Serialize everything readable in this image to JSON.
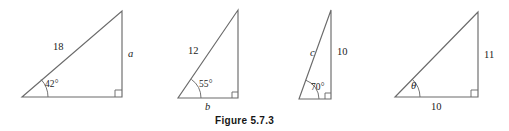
{
  "figure": {
    "caption": "Figure 5.7.3",
    "stroke_color": "#6b6b6b",
    "text_color": "#1c1c1c",
    "background": "#ffffff"
  },
  "triangles": [
    {
      "id": "triangle-1",
      "hypotenuse_label": "18",
      "angle_label": "42°",
      "vertical_label": "a",
      "base_label": "",
      "vertical_label_italic": true,
      "hypotenuse_label_italic": false,
      "geometry": {
        "left_x": 22,
        "base_y": 97,
        "right_x": 122,
        "apex_y": 11,
        "arc_radius": 26,
        "right_angle_size": 7
      }
    },
    {
      "id": "triangle-2",
      "hypotenuse_label": "12",
      "angle_label": "55°",
      "vertical_label": "",
      "base_label": "b",
      "base_label_italic": true,
      "hypotenuse_label_italic": false,
      "geometry": {
        "left_x": 178,
        "base_y": 98,
        "right_x": 238,
        "apex_y": 10,
        "arc_radius": 23,
        "right_angle_size": 6
      }
    },
    {
      "id": "triangle-3",
      "hypotenuse_label": "c",
      "angle_label": "70°",
      "vertical_label": "10",
      "base_label": "",
      "hypotenuse_label_italic": true,
      "vertical_label_italic": false,
      "geometry": {
        "left_x": 299,
        "base_y": 99,
        "right_x": 331,
        "apex_y": 10,
        "arc_radius": 20,
        "right_angle_size": 6
      }
    },
    {
      "id": "triangle-4",
      "hypotenuse_label": "",
      "angle_label": "θ",
      "vertical_label": "11",
      "base_label": "10",
      "angle_label_italic": true,
      "vertical_label_italic": false,
      "base_label_italic": false,
      "geometry": {
        "left_x": 395,
        "base_y": 97,
        "right_x": 478,
        "apex_y": 12,
        "arc_radius": 25,
        "right_angle_size": 7
      }
    }
  ]
}
